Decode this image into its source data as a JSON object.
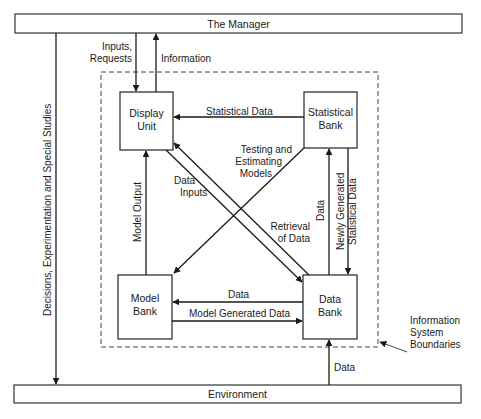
{
  "diagram": {
    "type": "flow",
    "outer_boxes": {
      "manager": "The Manager",
      "environment": "Environment"
    },
    "boundary_label": [
      "Information",
      "System",
      "Boundaries"
    ],
    "nodes": [
      {
        "id": "display_unit",
        "lines": [
          "Display",
          "Unit"
        ]
      },
      {
        "id": "statistical_bank",
        "lines": [
          "Statistical",
          "Bank"
        ]
      },
      {
        "id": "model_bank",
        "lines": [
          "Model",
          "Bank"
        ]
      },
      {
        "id": "data_bank",
        "lines": [
          "Data",
          "Bank"
        ]
      }
    ],
    "edges": [
      {
        "from": "manager",
        "to": "display_unit",
        "lines": [
          "Inputs,",
          "Requests"
        ]
      },
      {
        "from": "display_unit",
        "to": "manager",
        "label": "Information"
      },
      {
        "from": "statistical_bank",
        "to": "display_unit",
        "label": "Statistical Data"
      },
      {
        "from": "statistical_bank",
        "to": "model_bank",
        "lines": [
          "Testing and",
          "Estimating",
          "Models"
        ]
      },
      {
        "from": "display_unit",
        "to": "data_bank",
        "lines": [
          "Data",
          "Inputs"
        ]
      },
      {
        "from": "data_bank",
        "to": "display_unit",
        "lines": [
          "Retrieval",
          "of Data"
        ]
      },
      {
        "from": "model_bank",
        "to": "display_unit",
        "label": "Model Output"
      },
      {
        "from": "data_bank",
        "to": "statistical_bank",
        "label": "Data"
      },
      {
        "from": "statistical_bank",
        "to": "data_bank",
        "lines": [
          "Newly Generated",
          "Statistical Data"
        ]
      },
      {
        "from": "data_bank",
        "to": "model_bank",
        "label": "Data"
      },
      {
        "from": "model_bank",
        "to": "data_bank",
        "label": "Model Generated Data"
      },
      {
        "from": "environment",
        "to": "data_bank",
        "label": "Data"
      },
      {
        "from": "manager",
        "to": "environment",
        "label": "Decisions, Experimentation and Special Studies"
      }
    ]
  }
}
